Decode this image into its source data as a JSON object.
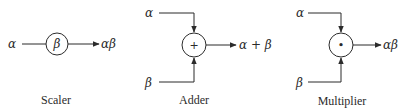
{
  "diagram": {
    "colors": {
      "stroke": "#2b2b2b",
      "background": "#ffffff"
    },
    "blocks": [
      {
        "name": "scaler",
        "caption": "Scaler",
        "inputs": [
          "α"
        ],
        "node_symbol": "β",
        "output": "αβ"
      },
      {
        "name": "adder",
        "caption": "Adder",
        "inputs": [
          "α",
          "β"
        ],
        "node_symbol": "+",
        "output": "α + β"
      },
      {
        "name": "multiplier",
        "caption": "Multiplier",
        "inputs": [
          "α",
          "β"
        ],
        "node_symbol": "•",
        "output": "αβ"
      }
    ]
  }
}
